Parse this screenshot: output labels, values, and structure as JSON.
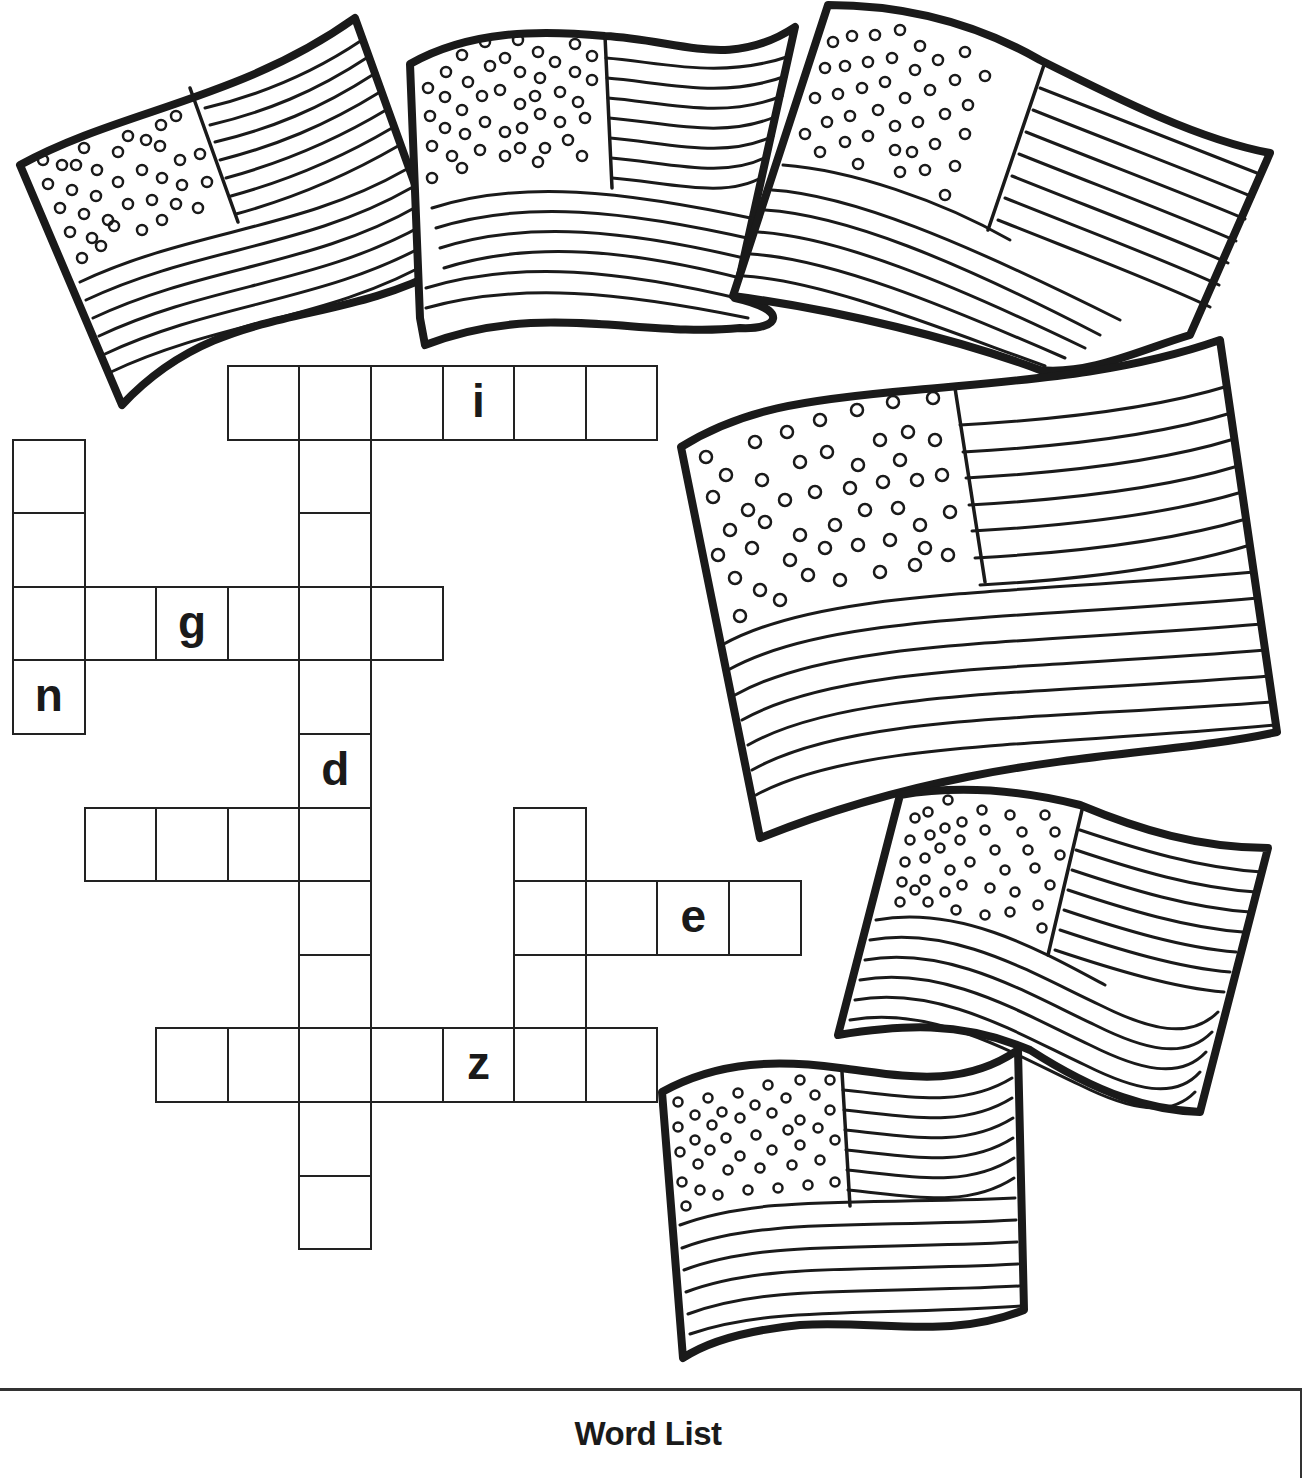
{
  "page": {
    "type": "crossword-worksheet",
    "theme": "american-flags"
  },
  "grid": {
    "origin_x": 12,
    "origin_y": 365,
    "cell_w": 71.6,
    "cell_h": 73.6,
    "words": [
      {
        "id": "across-1",
        "direction": "across",
        "row": 0,
        "col": 3,
        "length": 6,
        "hints": {
          "3": "i"
        }
      },
      {
        "id": "across-2",
        "direction": "across",
        "row": 3,
        "col": 0,
        "length": 6,
        "hints": {
          "2": "g"
        }
      },
      {
        "id": "across-3",
        "direction": "across",
        "row": 6,
        "col": 1,
        "length": 4,
        "hints": {}
      },
      {
        "id": "across-4",
        "direction": "across",
        "row": 7,
        "col": 7,
        "length": 4,
        "hints": {
          "2": "e"
        }
      },
      {
        "id": "across-5",
        "direction": "across",
        "row": 9,
        "col": 2,
        "length": 7,
        "hints": {
          "4": "z"
        }
      },
      {
        "id": "down-1",
        "direction": "down",
        "row": 1,
        "col": 0,
        "length": 4,
        "hints": {
          "3": "n"
        }
      },
      {
        "id": "down-2",
        "direction": "down",
        "row": 0,
        "col": 4,
        "length": 12,
        "hints": {
          "5": "d"
        }
      },
      {
        "id": "down-3",
        "direction": "down",
        "row": 6,
        "col": 7,
        "length": 4,
        "hints": {}
      }
    ],
    "given_letters": [
      {
        "row": 0,
        "col": 6,
        "letter": "i"
      },
      {
        "row": 3,
        "col": 2,
        "letter": "g"
      },
      {
        "row": 4,
        "col": 0,
        "letter": "n"
      },
      {
        "row": 5,
        "col": 4,
        "letter": "d"
      },
      {
        "row": 7,
        "col": 9,
        "letter": "e"
      },
      {
        "row": 9,
        "col": 6,
        "letter": "z"
      }
    ]
  },
  "flags": [
    {
      "name": "flag-top-left",
      "icon": "us-flag-icon"
    },
    {
      "name": "flag-top-center",
      "icon": "us-flag-icon"
    },
    {
      "name": "flag-top-right",
      "icon": "us-flag-icon"
    },
    {
      "name": "flag-middle-right-large",
      "icon": "us-flag-icon"
    },
    {
      "name": "flag-lower-right",
      "icon": "us-flag-icon"
    },
    {
      "name": "flag-bottom-center",
      "icon": "us-flag-icon"
    }
  ],
  "word_list": {
    "title": "Word List"
  },
  "colors": {
    "ink": "#1a1a1a",
    "paper": "#ffffff"
  }
}
